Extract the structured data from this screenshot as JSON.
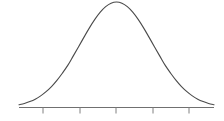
{
  "figure": {
    "background_color": "#ffffff",
    "width": 224,
    "height": 121,
    "title": "",
    "caption": ""
  },
  "style": {
    "curve_color": "#4a4a4a",
    "axis_color": "#707070",
    "tick_color": "#808080",
    "curve_line_width": 1.1
  },
  "chart_data": {
    "type": "line",
    "title": "",
    "subtitle": "",
    "xlabel": "",
    "ylabel": "",
    "legend": [],
    "legend_position": "none",
    "grid": false,
    "annotations": [],
    "distribution": "normal",
    "mean": 0,
    "std_dev": 1,
    "xlim": [
      -2.7,
      2.7
    ],
    "ylim": [
      0,
      1
    ],
    "x_tick_labels": [
      "",
      "",
      "",
      "",
      ""
    ],
    "x_tick_values": [
      -2,
      -1,
      0,
      1,
      2
    ],
    "y_tick_labels": [],
    "y_tick_values": [],
    "series": [
      {
        "name": "normal-pdf",
        "x": [
          -2.7,
          -2.55,
          -2.4,
          -2.25,
          -2.1,
          -1.95,
          -1.8,
          -1.65,
          -1.5,
          -1.35,
          -1.2,
          -1.05,
          -0.9,
          -0.75,
          -0.6,
          -0.45,
          -0.3,
          -0.15,
          0.0,
          0.15,
          0.3,
          0.45,
          0.6,
          0.75,
          0.9,
          1.05,
          1.2,
          1.35,
          1.5,
          1.65,
          1.8,
          1.95,
          2.1,
          2.25,
          2.4,
          2.55,
          2.7
        ],
        "values": [
          0.026,
          0.038,
          0.056,
          0.079,
          0.11,
          0.15,
          0.198,
          0.257,
          0.325,
          0.399,
          0.487,
          0.576,
          0.667,
          0.755,
          0.835,
          0.904,
          0.956,
          0.989,
          1.0,
          0.989,
          0.956,
          0.904,
          0.835,
          0.755,
          0.667,
          0.576,
          0.487,
          0.399,
          0.325,
          0.257,
          0.198,
          0.15,
          0.11,
          0.079,
          0.056,
          0.038,
          0.026
        ]
      }
    ]
  },
  "geometry": {
    "baseline_y": 107.5,
    "axis_x_start": 19,
    "axis_x_end": 214,
    "peak_x": 117,
    "peak_y": 2,
    "tick_length": 6,
    "tick_positions_px": [
      43,
      80,
      116,
      153,
      189
    ]
  }
}
